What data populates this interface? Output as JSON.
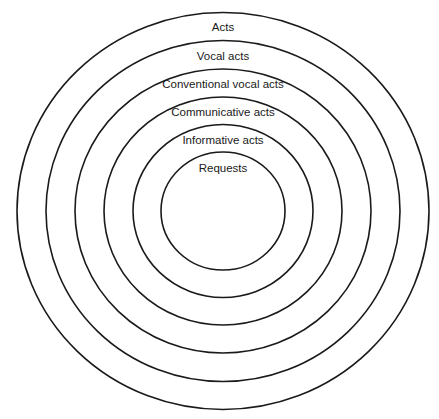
{
  "diagram": {
    "type": "nested-concentric-circles",
    "center": [
      223,
      211
    ],
    "rings": [
      {
        "label": "Acts",
        "rx": 206,
        "ry": 198.5,
        "label_y": 31
      },
      {
        "label": "Vocal acts",
        "rx": 177,
        "ry": 170.5,
        "label_y": 60
      },
      {
        "label": "Conventional vocal acts",
        "rx": 148,
        "ry": 142,
        "label_y": 88
      },
      {
        "label": "Communicative acts",
        "rx": 119,
        "ry": 114,
        "label_y": 116
      },
      {
        "label": "Informative acts",
        "rx": 90,
        "ry": 86.5,
        "label_y": 144
      },
      {
        "label": "Requests",
        "rx": 62,
        "ry": 59,
        "label_y": 172
      }
    ]
  }
}
